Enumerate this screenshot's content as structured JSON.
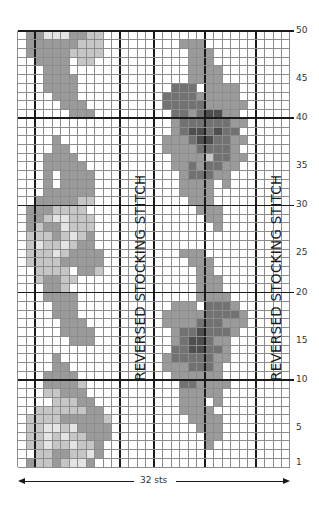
{
  "chart_data": {
    "type": "heatmap",
    "columns": 32,
    "rows": 50,
    "width_label": "32 sts",
    "row_labels": [
      "1",
      "5",
      "10",
      "15",
      "20",
      "25",
      "30",
      "35",
      "40",
      "45",
      "50"
    ],
    "row_label_values": [
      1,
      5,
      10,
      15,
      20,
      25,
      30,
      35,
      40,
      45,
      50
    ],
    "thick_row_lines_after": [
      10,
      20,
      30,
      40
    ],
    "thick_col_lines_after": [
      2,
      12,
      16,
      22,
      28
    ],
    "annotations": [
      {
        "text": "REVERSED STOCKING STITCH",
        "column_range": [
          13,
          16
        ],
        "orientation": "vertical"
      },
      {
        "text": "REVERSED STOCKING STITCH",
        "column_range": [
          29,
          32
        ],
        "orientation": "vertical"
      }
    ],
    "legend": {
      ".": "#ffffff",
      "v": "#e4e4e4",
      "l": "#c6c6c6",
      "m": "#9a9a9a",
      "d": "#727272",
      "x": "#4e4e4e"
    },
    "grid_top_to_bottom": [
      ".mmvvvmmll......................",
      ".mmmmmmlll.........mmm..........",
      ".mmmmmllll..........mmm.........",
      "..mmmm.ll...........mmm.........",
      "...mmm..............mmmm........",
      "...mmmm.............mmmm........",
      "...mmmm...........ddd.mmmm......",
      "....mmm..........ddddmmmmm......",
      ".....mmm.........dddddmmmmm.....",
      "......mmm.........ddmdxxmm......",
      "..................mddddddmm.....",
      "..................mdxxdxdd......",
      "....m............mmmdxxddmm.....",
      "....mm...........mmmmddddm......",
      "...mmmm...........mmmmlddmm.....",
      "...mmmmm..........mmdmddmm......",
      "...m.mmmm..........mdddmm.......",
      "...m.mmmm..........mmmm.m.......",
      "...mmmmmm..........mmmm.........",
      "..mmmmmll...........mmm.........",
      ".mmmllll.............mmm........",
      ".mmlvvlll.............mm........",
      ".mlmmvlll..............m........",
      ".lllmlvlm.......................",
      ".lvllvlmm.......................",
      ".lllvlmmmm.........mmm..........",
      ".llllmmmmm..........mmm.........",
      "..llll.mml...........mm.........",
      "..lmmll..............mmm........",
      "...mml...............mmm........",
      "...mmmm..............mmmm.......",
      "....mmm...........mmm.dddm......",
      "....mmm..........mmmmmddddm.....",
      ".....mmm.........mmmmdddmmm.....",
      ".....mmmm.........mddxdddm......",
      "......mmm.........mdxxdmm.......",
      "..................ddxxddm.......",
      "....m............mdddddmm.......",
      "....mm...........mmmdddm........",
      "...mmmm...........mmmmmm........",
      "...mmmml...........ddmmmm.......",
      "...llmmm...........mmmmm........",
      "....lllmm..........mmm.m........",
      "..llllllmm.........mmmm.........",
      ".llllmmmmml.........mmmm........",
      ".llvvlvmmmm..........mmm........",
      ".llvlvllmmm...........mm........",
      ".llvllvllm............m.........",
      "..llmmllvm......................",
      ".mllmlvvm......................."
    ]
  }
}
